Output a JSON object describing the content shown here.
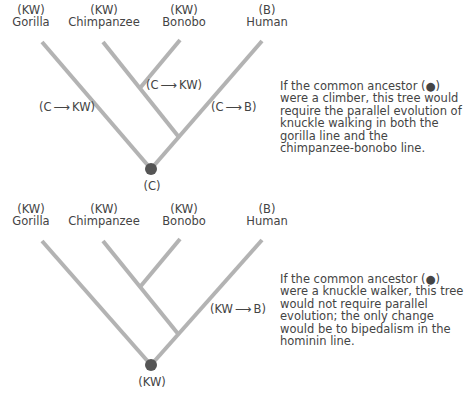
{
  "colors": {
    "branch": "#b3b3b3",
    "node": "#555555",
    "text": "#444444"
  },
  "panels": [
    {
      "taxa": [
        {
          "state": "(KW)",
          "name": "Gorilla"
        },
        {
          "state": "(KW)",
          "name": "Chimpanzee"
        },
        {
          "state": "(KW)",
          "name": "Bonobo"
        },
        {
          "state": "(B)",
          "name": "Human"
        }
      ],
      "transitions": [
        {
          "from": "C",
          "to": "KW",
          "branch": "gorilla",
          "text_from": "(C",
          "text_to": "KW)"
        },
        {
          "from": "C",
          "to": "KW",
          "branch": "chimpanzee-bonobo",
          "text_from": "(C",
          "text_to": "KW)"
        },
        {
          "from": "C",
          "to": "B",
          "branch": "human",
          "text_from": "(C",
          "text_to": "B)"
        }
      ],
      "root_label": "(C)",
      "caption": "If the common ancestor (●) were a climber, this tree would require the parallel evolution of knuckle walking in both the gorilla line and the chimpanzee-bonobo line."
    },
    {
      "taxa": [
        {
          "state": "(KW)",
          "name": "Gorilla"
        },
        {
          "state": "(KW)",
          "name": "Chimpanzee"
        },
        {
          "state": "(KW)",
          "name": "Bonobo"
        },
        {
          "state": "(B)",
          "name": "Human"
        }
      ],
      "transitions": [
        {
          "from": "KW",
          "to": "B",
          "branch": "human",
          "text_from": "(KW",
          "text_to": "B)"
        }
      ],
      "root_label": "(KW)",
      "caption": "If the common ancestor (●) were a knuckle walker, this tree would not require parallel evolution; the only change would be to bipedalism in the hominin line."
    }
  ]
}
